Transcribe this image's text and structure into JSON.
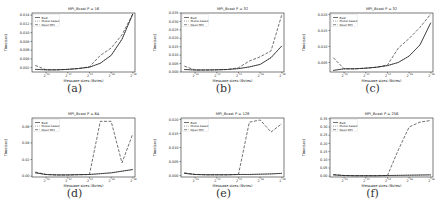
{
  "figure": {
    "captions": [
      "(a)",
      "(b)",
      "(c)",
      "(d)",
      "(e)",
      "(f)"
    ]
  },
  "chart_data": [
    {
      "type": "line",
      "title": "MPI_Bcast P = 16",
      "xlabel": "Message sizes (Bytes)",
      "ylabel": "Time(sec)",
      "x_ticks": [
        "2^10",
        "2^12",
        "2^14",
        "2^16",
        "2^18"
      ],
      "x": [
        9,
        10,
        11,
        12,
        13,
        14,
        15,
        16,
        17,
        18
      ],
      "y_ticks": [
        "0.002",
        "0.004",
        "0.006",
        "0.008",
        "0.010",
        "0.012",
        "0.014"
      ],
      "ylim": [
        0.001,
        0.0145
      ],
      "legend": [
        "Best",
        "Model-based",
        "Open MPI"
      ],
      "legend_position": "upper left",
      "series": [
        {
          "name": "Best",
          "style": "solid",
          "values": [
            0.0016,
            0.0015,
            0.0015,
            0.0016,
            0.0018,
            0.0021,
            0.003,
            0.0048,
            0.0085,
            0.0143
          ]
        },
        {
          "name": "Model-based",
          "style": "dotted",
          "values": [
            0.0016,
            0.0015,
            0.0015,
            0.0016,
            0.0018,
            0.0021,
            0.003,
            0.0048,
            0.0085,
            0.0143
          ]
        },
        {
          "name": "Open MPI",
          "style": "dashed",
          "values": [
            0.0025,
            0.0015,
            0.0015,
            0.0016,
            0.0018,
            0.0022,
            0.0048,
            0.0065,
            0.0095,
            0.0143
          ]
        }
      ]
    },
    {
      "type": "line",
      "title": "MPI_Bcast P = 32",
      "xlabel": "Message sizes (Bytes)",
      "ylabel": "Time(sec)",
      "x_ticks": [
        "2^10",
        "2^12",
        "2^14",
        "2^16",
        "2^18"
      ],
      "x": [
        9,
        10,
        11,
        12,
        13,
        14,
        15,
        16,
        17,
        18
      ],
      "y_ticks": [
        "0.000",
        "0.005",
        "0.010",
        "0.015",
        "0.020",
        "0.025",
        "0.030",
        "0.035"
      ],
      "ylim": [
        0,
        0.035
      ],
      "legend": [
        "Best",
        "Model-based",
        "Open MPI"
      ],
      "legend_position": "upper left",
      "series": [
        {
          "name": "Best",
          "style": "solid",
          "values": [
            0.0015,
            0.0012,
            0.0012,
            0.0013,
            0.0015,
            0.002,
            0.003,
            0.0045,
            0.0085,
            0.0155
          ]
        },
        {
          "name": "Model-based",
          "style": "dotted",
          "values": [
            0.0015,
            0.0012,
            0.0012,
            0.0013,
            0.0015,
            0.002,
            0.003,
            0.0045,
            0.0085,
            0.0155
          ]
        },
        {
          "name": "Open MPI",
          "style": "dashed",
          "values": [
            0.0035,
            0.0012,
            0.0012,
            0.0013,
            0.0015,
            0.0025,
            0.0065,
            0.009,
            0.0125,
            0.034
          ]
        }
      ]
    },
    {
      "type": "line",
      "title": "MPI_Bcast P = 32",
      "xlabel": "Message sizes (Bytes)",
      "ylabel": "Time(sec)",
      "x_ticks": [
        "2^10",
        "2^12",
        "2^14",
        "2^16",
        "2^18"
      ],
      "x": [
        9,
        10,
        11,
        12,
        13,
        14,
        15,
        16,
        17,
        18
      ],
      "y_ticks": [
        "0.005",
        "0.010",
        "0.015",
        "0.020"
      ],
      "ylim": [
        0.002,
        0.0205
      ],
      "legend": [
        "Best",
        "Model-based",
        "Open MPI"
      ],
      "legend_position": "upper left",
      "series": [
        {
          "name": "Best",
          "style": "solid",
          "values": [
            0.0025,
            0.003,
            0.003,
            0.0032,
            0.0035,
            0.004,
            0.005,
            0.007,
            0.0105,
            0.0175
          ]
        },
        {
          "name": "Model-based",
          "style": "dotted",
          "values": [
            0.0025,
            0.003,
            0.003,
            0.0032,
            0.0035,
            0.004,
            0.005,
            0.007,
            0.0105,
            0.0175
          ]
        },
        {
          "name": "Open MPI",
          "style": "dashed",
          "values": [
            0.0065,
            0.003,
            0.003,
            0.0032,
            0.0035,
            0.0042,
            0.0095,
            0.0125,
            0.016,
            0.0202
          ]
        }
      ]
    },
    {
      "type": "line",
      "title": "MPI_Bcast P = 64",
      "xlabel": "Message sizes (Bytes)",
      "ylabel": "Time(sec)",
      "x_ticks": [
        "2^10",
        "2^12",
        "2^14",
        "2^16",
        "2^18"
      ],
      "x": [
        9,
        10,
        11,
        12,
        13,
        14,
        15,
        16,
        17,
        18
      ],
      "y_ticks": [
        "0.00",
        "0.02",
        "0.04",
        "0.06"
      ],
      "ylim": [
        -0.001,
        0.07
      ],
      "legend": [
        "Best",
        "Model-based",
        "Open MPI"
      ],
      "legend_position": "upper left",
      "series": [
        {
          "name": "Best",
          "style": "solid",
          "values": [
            0.004,
            0.002,
            0.0015,
            0.0015,
            0.0018,
            0.002,
            0.003,
            0.004,
            0.006,
            0.008
          ]
        },
        {
          "name": "Model-based",
          "style": "dotted",
          "values": [
            0.004,
            0.002,
            0.0015,
            0.0015,
            0.0018,
            0.002,
            0.003,
            0.004,
            0.006,
            0.008
          ]
        },
        {
          "name": "Open MPI",
          "style": "dashed",
          "values": [
            0.005,
            0.002,
            0.0015,
            0.0015,
            0.0018,
            0.002,
            0.066,
            0.066,
            0.016,
            0.051
          ]
        }
      ]
    },
    {
      "type": "line",
      "title": "MPI_Bcast P = 128",
      "xlabel": "Message sizes (Bytes)",
      "ylabel": "Time(sec)",
      "x_ticks": [
        "2^10",
        "2^12",
        "2^14",
        "2^16",
        "2^18"
      ],
      "x": [
        9,
        10,
        11,
        12,
        13,
        14,
        15,
        16,
        17,
        18
      ],
      "y_ticks": [
        "0.000",
        "0.005",
        "0.010",
        "0.015",
        "0.020"
      ],
      "ylim": [
        -0.0005,
        0.0205
      ],
      "legend": [
        "Best",
        "Model-based",
        "Open MPI"
      ],
      "legend_position": "upper left",
      "series": [
        {
          "name": "Best",
          "style": "solid",
          "values": [
            0.0008,
            0.0004,
            0.0003,
            0.0003,
            0.0003,
            0.0004,
            0.0004,
            0.0005,
            0.0006,
            0.0008
          ]
        },
        {
          "name": "Model-based",
          "style": "dotted",
          "values": [
            0.0008,
            0.0004,
            0.0003,
            0.0003,
            0.0003,
            0.0004,
            0.0004,
            0.0005,
            0.0006,
            0.0008
          ]
        },
        {
          "name": "Open MPI",
          "style": "dashed",
          "values": [
            0.001,
            0.0004,
            0.0003,
            0.0003,
            0.0003,
            0.0004,
            0.019,
            0.0198,
            0.0155,
            0.0185
          ]
        }
      ]
    },
    {
      "type": "line",
      "title": "MPI_Bcast P = 256",
      "xlabel": "Message sizes (Bytes)",
      "ylabel": "Time(sec)",
      "x_ticks": [
        "2^10",
        "2^12",
        "2^14",
        "2^16",
        "2^18"
      ],
      "x": [
        9,
        10,
        11,
        12,
        13,
        14,
        15,
        16,
        17,
        18
      ],
      "y_ticks": [
        "0.00",
        "0.05",
        "0.10",
        "0.15",
        "0.20",
        "0.25",
        "0.30",
        "0.35"
      ],
      "ylim": [
        -0.005,
        0.355
      ],
      "legend": [
        "Best",
        "Model-based",
        "Open MPI"
      ],
      "legend_position": "upper left",
      "series": [
        {
          "name": "Best",
          "style": "solid",
          "values": [
            0.008,
            0.004,
            0.003,
            0.003,
            0.003,
            0.004,
            0.005,
            0.006,
            0.007,
            0.008
          ]
        },
        {
          "name": "Model-based",
          "style": "dotted",
          "values": [
            0.008,
            0.004,
            0.003,
            0.003,
            0.003,
            0.004,
            0.005,
            0.006,
            0.007,
            0.008
          ]
        },
        {
          "name": "Open MPI",
          "style": "dashed",
          "values": [
            0.01,
            0.004,
            0.003,
            0.003,
            0.003,
            0.004,
            0.16,
            0.3,
            0.33,
            0.34
          ]
        }
      ]
    }
  ]
}
